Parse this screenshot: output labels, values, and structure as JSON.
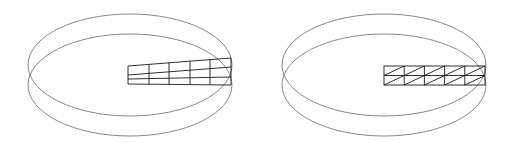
{
  "figures": [
    {
      "name": "deformed-mesh-in-ring",
      "rings": [
        {
          "cx": 130,
          "cy": 65,
          "rx": 102,
          "ry": 51
        },
        {
          "cx": 130,
          "cy": 85,
          "rx": 102,
          "ry": 51
        }
      ],
      "mesh": {
        "type": "tapered-quad",
        "columns_x": [
          128,
          149,
          169,
          190,
          210,
          231
        ],
        "rows": [
          {
            "y_left": 66,
            "y_right": 58
          },
          {
            "y_left": 75,
            "y_right": 67
          },
          {
            "y_left": 79,
            "y_right": 77
          },
          {
            "y_left": 84,
            "y_right": 85
          }
        ]
      }
    },
    {
      "name": "triangulated-mesh-in-ring",
      "rings": [
        {
          "cx": 384,
          "cy": 65,
          "rx": 102,
          "ry": 51
        },
        {
          "cx": 384,
          "cy": 85,
          "rx": 102,
          "ry": 51
        }
      ],
      "mesh": {
        "type": "triangulated-rect",
        "x0": 384,
        "x1": 485,
        "y0": 66,
        "y1": 85,
        "ymid": 75.5,
        "columns": 5
      }
    }
  ],
  "colors": {
    "ring": "#7a7a7a",
    "mesh": "#1a1a1a",
    "background": "#ffffff"
  }
}
